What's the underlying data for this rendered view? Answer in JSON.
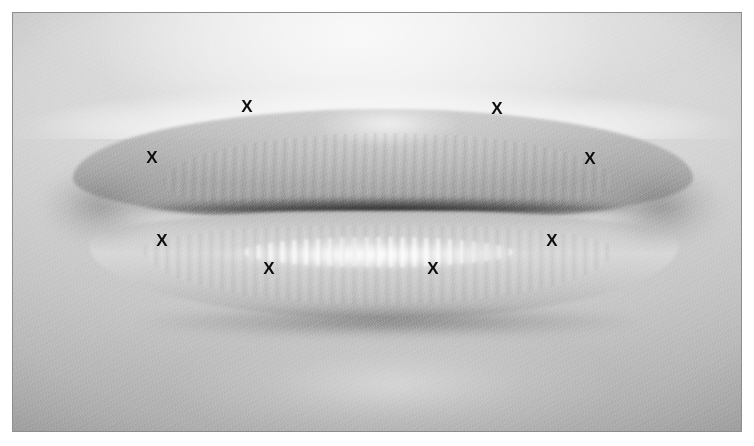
{
  "figure": {
    "kind": "clinical-photograph",
    "color_mode": "grayscale",
    "frame": {
      "border_color": "#8e8e8e",
      "page_background": "#ffffff",
      "photo_left": 12,
      "photo_top": 12,
      "photo_width": 730,
      "photo_height": 420
    },
    "palette": {
      "skin_light": "#e4e4e4",
      "skin_mid": "#c6c6c6",
      "skin_dark": "#a2a2a2",
      "upper_lip": "#b4b4b4",
      "lower_lip": "#d8d8d8",
      "mouth_line": "#3a3a3a",
      "highlight": "#ffffff",
      "marker_color": "#0d0d0d"
    },
    "regions": [
      {
        "id": "philtrum",
        "label": "Upper lip skin / philtrum"
      },
      {
        "id": "vermilion-ridge",
        "label": "Vermilion border ridge"
      },
      {
        "id": "cupids-bow",
        "label": "Cupid's bow"
      },
      {
        "id": "upper-lip",
        "label": "Upper lip vermilion"
      },
      {
        "id": "mouth-line",
        "label": "Oral commissure line"
      },
      {
        "id": "lower-lip",
        "label": "Lower lip vermilion"
      },
      {
        "id": "lower-lip-highlight",
        "label": "Specular highlight band"
      },
      {
        "id": "sublabial-shadow",
        "label": "Labiomental crease shadow"
      },
      {
        "id": "chin",
        "label": "Chin"
      }
    ]
  },
  "markers": {
    "glyph": "X",
    "count": 8,
    "points": [
      {
        "id": "m1",
        "glyph": "X",
        "x": 151,
        "y": 156,
        "region": "upper-lip-left-outer"
      },
      {
        "id": "m2",
        "glyph": "X",
        "x": 246,
        "y": 105,
        "region": "upper-lip-left-bow"
      },
      {
        "id": "m3",
        "glyph": "X",
        "x": 496,
        "y": 107,
        "region": "upper-lip-right-bow"
      },
      {
        "id": "m4",
        "glyph": "X",
        "x": 589,
        "y": 157,
        "region": "upper-lip-right-outer"
      },
      {
        "id": "m5",
        "glyph": "X",
        "x": 161,
        "y": 239,
        "region": "lower-lip-left-outer"
      },
      {
        "id": "m6",
        "glyph": "X",
        "x": 268,
        "y": 267,
        "region": "lower-lip-left-inner"
      },
      {
        "id": "m7",
        "glyph": "X",
        "x": 432,
        "y": 267,
        "region": "lower-lip-right-inner"
      },
      {
        "id": "m8",
        "glyph": "X",
        "x": 551,
        "y": 239,
        "region": "lower-lip-right-outer"
      }
    ]
  }
}
